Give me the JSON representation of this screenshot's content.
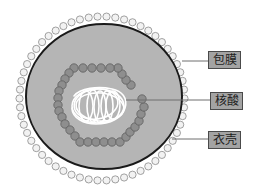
{
  "diagram": {
    "labels": [
      {
        "id": "envelope",
        "text": "包膜",
        "box": {
          "x": 208,
          "y": 51
        },
        "leader": {
          "x1": 182,
          "y1": 61,
          "x2": 208,
          "y2": 61
        }
      },
      {
        "id": "nucleic-acid",
        "text": "核酸",
        "box": {
          "x": 210,
          "y": 92
        },
        "leader": {
          "x1": 126,
          "y1": 100,
          "x2": 210,
          "y2": 100
        }
      },
      {
        "id": "capsid",
        "text": "衣壳",
        "box": {
          "x": 208,
          "y": 131
        },
        "leader": {
          "x1": 172,
          "y1": 139,
          "x2": 208,
          "y2": 139
        }
      }
    ],
    "colors": {
      "background": "#ffffff",
      "virus_body": "#b5b5b5",
      "outline": "#1a1a1a",
      "envelope_bead_fill": "#f2f2f2",
      "envelope_bead_stroke": "#8a8a8a",
      "capsid_bead_fill": "#8e8e8e",
      "capsid_bead_stroke": "#5e5e5e",
      "nucleic_acid": "#ffffff",
      "label_fill": "#a3a3a3",
      "label_border": "#4a4a4a",
      "leader_line": "#6e6e6e"
    }
  }
}
